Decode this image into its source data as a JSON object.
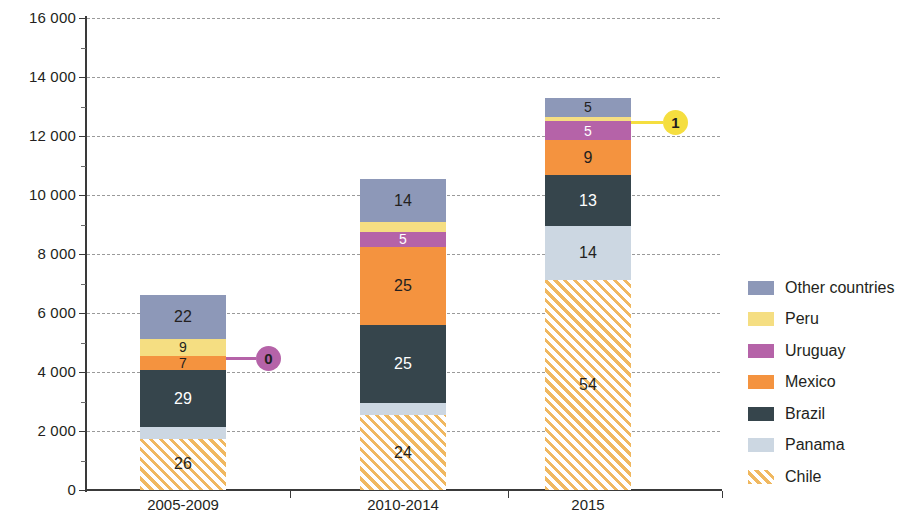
{
  "chart_data": {
    "type": "bar",
    "subtype": "stacked-vertical",
    "title": "",
    "subtitle": "",
    "xlabel": "",
    "ylabel": "",
    "categories": [
      "2005-2009",
      "2010-2014",
      "2015"
    ],
    "ylim": [
      0,
      16000
    ],
    "ytick_step": 2000,
    "ytick_labels": [
      "0",
      "2 000",
      "4 000",
      "6 000",
      "8 000",
      "10 000",
      "12 000",
      "14 000",
      "16 000"
    ],
    "ytick_values": [
      0,
      2000,
      4000,
      6000,
      8000,
      10000,
      12000,
      14000,
      16000
    ],
    "grid": "horizontal-dashed",
    "legend_position": "right",
    "value_unit": "percent",
    "totals": [
      6600,
      10550,
      13300
    ],
    "series": [
      {
        "name": "Chile",
        "color": "#f0b860",
        "pattern": "diagonal-hatch",
        "values": [
          26,
          24,
          54
        ],
        "labels": [
          "26",
          "24",
          "54"
        ],
        "label_colors": [
          "#231f20",
          "#231f20",
          "#231f20"
        ]
      },
      {
        "name": "Panama",
        "color": "#ccd7e2",
        "pattern": "solid",
        "values": [
          6,
          4,
          14
        ],
        "labels": [
          "6",
          "4",
          "14"
        ],
        "label_colors": [
          "#231f20",
          "#231f20",
          "#231f20"
        ]
      },
      {
        "name": "Brazil",
        "color": "#36454c",
        "pattern": "solid",
        "values": [
          29,
          25,
          13
        ],
        "labels": [
          "29",
          "25",
          "13"
        ],
        "label_colors": [
          "#ffffff",
          "#ffffff",
          "#ffffff"
        ]
      },
      {
        "name": "Mexico",
        "color": "#f4933f",
        "pattern": "solid",
        "values": [
          7,
          25,
          9
        ],
        "labels": [
          "7",
          "25",
          "9"
        ],
        "label_colors": [
          "#231f20",
          "#231f20",
          "#231f20"
        ]
      },
      {
        "name": "Uruguay",
        "color": "#b563a8",
        "pattern": "solid",
        "values": [
          0,
          5,
          5
        ],
        "labels": [
          "0",
          "5",
          "5"
        ],
        "label_colors": [
          "#ffffff",
          "#ffffff",
          "#ffffff"
        ]
      },
      {
        "name": "Peru",
        "color": "#f5de82",
        "pattern": "solid",
        "values": [
          9,
          3,
          1
        ],
        "labels": [
          "9",
          "3",
          "1"
        ],
        "label_colors": [
          "#231f20",
          "#231f20",
          "#231f20"
        ]
      },
      {
        "name": "Other countries",
        "color": "#8d98b8",
        "pattern": "solid",
        "values": [
          22,
          14,
          5
        ],
        "labels": [
          "22",
          "14",
          "5"
        ],
        "label_colors": [
          "#231f20",
          "#231f20",
          "#231f20"
        ]
      }
    ],
    "callouts": [
      {
        "series": "Uruguay",
        "category": "2005-2009",
        "label": "0",
        "color": "#b563a8",
        "text_color": "#231f20"
      },
      {
        "series": "Peru",
        "category": "2015",
        "label": "1",
        "color": "#f5de3f",
        "text_color": "#231f20"
      }
    ]
  },
  "legend": {
    "items": [
      {
        "label": "Other countries",
        "color": "#8d98b8",
        "pattern": "solid"
      },
      {
        "label": "Peru",
        "color": "#f5de82",
        "pattern": "solid"
      },
      {
        "label": "Uruguay",
        "color": "#b563a8",
        "pattern": "solid"
      },
      {
        "label": "Mexico",
        "color": "#f4933f",
        "pattern": "solid"
      },
      {
        "label": "Brazil",
        "color": "#36454c",
        "pattern": "solid"
      },
      {
        "label": "Panama",
        "color": "#ccd7e2",
        "pattern": "solid"
      },
      {
        "label": "Chile",
        "color": "#f0b860",
        "pattern": "diagonal-hatch"
      }
    ]
  }
}
